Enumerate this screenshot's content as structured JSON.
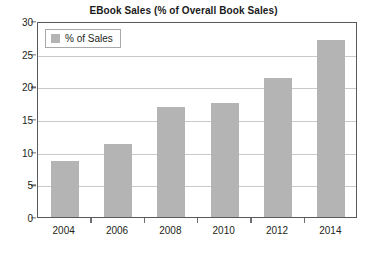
{
  "chart_data": {
    "type": "bar",
    "title": "EBook Sales (% of Overall Book Sales)",
    "categories": [
      "2004",
      "2006",
      "2008",
      "2010",
      "2012",
      "2014"
    ],
    "values": [
      8.5,
      11.2,
      16.8,
      17.5,
      21.3,
      27.1
    ],
    "series": [
      {
        "name": "% of Sales",
        "values": [
          8.5,
          11.2,
          16.8,
          17.5,
          21.3,
          27.1
        ]
      }
    ],
    "xlabel": "",
    "ylabel": "",
    "ylim": [
      0,
      30
    ],
    "yticks": [
      0,
      5,
      10,
      15,
      20,
      25,
      30
    ],
    "ytick_labels": [
      "0",
      "5",
      "10",
      "15",
      "20",
      "25",
      "30"
    ],
    "grid": true,
    "legend": {
      "position": "top-left-inside",
      "entries": [
        "% of Sales"
      ]
    },
    "colors": {
      "bar": "#b4b4b4",
      "plot_border": "#58595b",
      "gridline": "#c9c9c9",
      "text": "#231f20",
      "background": "#ffffff"
    }
  }
}
